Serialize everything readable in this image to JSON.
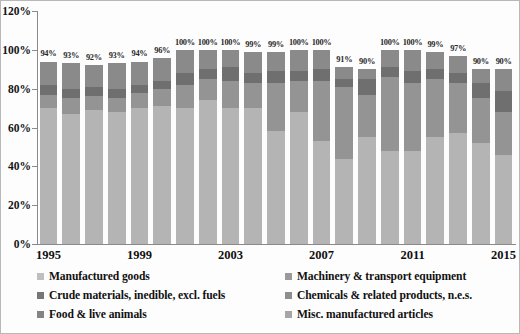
{
  "chart_data": {
    "type": "bar",
    "title": "",
    "subtitle": "",
    "xlabel": "",
    "ylabel": "",
    "stacked": true,
    "grid": false,
    "legend_position": "bottom",
    "ylim": [
      0,
      120
    ],
    "ytick_labels": [
      "0%",
      "20%",
      "40%",
      "60%",
      "80%",
      "100%",
      "120%"
    ],
    "ytick_values": [
      0,
      20,
      40,
      60,
      80,
      100,
      120
    ],
    "categories": [
      1995,
      1996,
      1997,
      1998,
      1999,
      2000,
      2001,
      2002,
      2003,
      2004,
      2005,
      2006,
      2007,
      2008,
      2009,
      2010,
      2011,
      2012,
      2013,
      2014,
      2015
    ],
    "xtick_labels": [
      "1995",
      "1999",
      "2003",
      "2007",
      "2011",
      "2015"
    ],
    "xtick_positions": [
      1995,
      1999,
      2003,
      2007,
      2011,
      2015
    ],
    "data_labels": [
      "94%",
      "93%",
      "92%",
      "93%",
      "94%",
      "96%",
      "100%",
      "100%",
      "100%",
      "99%",
      "99%",
      "100%",
      "100%",
      "91%",
      "90%",
      "100%",
      "100%",
      "99%",
      "97%",
      "90%",
      "90%"
    ],
    "totals": [
      94,
      93,
      92,
      93,
      94,
      96,
      100,
      100,
      100,
      99,
      99,
      100,
      100,
      91,
      90,
      100,
      100,
      99,
      97,
      90,
      90
    ],
    "series": [
      {
        "name": "Manufactured goods",
        "color": "#b4b4b4",
        "values": [
          70,
          67,
          69,
          68,
          70,
          71,
          70,
          74,
          70,
          70,
          58,
          68,
          53,
          44,
          55,
          48,
          48,
          55,
          57,
          52,
          46
        ]
      },
      {
        "name": "Machinery & transport equipment",
        "color": "#949494",
        "values": [
          7,
          8,
          7,
          7,
          8,
          9,
          12,
          11,
          14,
          13,
          25,
          16,
          31,
          37,
          22,
          38,
          35,
          30,
          26,
          23,
          22
        ]
      },
      {
        "name": "Crude materials, inedible, excl. fuels",
        "color": "#6f6f6f",
        "values": [
          5,
          5,
          5,
          5,
          4,
          4,
          6,
          5,
          7,
          5,
          6,
          5,
          6,
          4,
          8,
          5,
          6,
          5,
          5,
          8,
          11
        ]
      },
      {
        "name": "Chemicals & related products, n.e.s.",
        "color": "#8a8a8a",
        "values": [
          12,
          13,
          11,
          13,
          12,
          12,
          12,
          10,
          9,
          11,
          10,
          11,
          10,
          6,
          5,
          9,
          11,
          9,
          9,
          7,
          11
        ]
      },
      {
        "name": "Food & live animals",
        "color": "#808080",
        "values": [
          0,
          0,
          0,
          0,
          0,
          0,
          0,
          0,
          0,
          0,
          0,
          0,
          0,
          0,
          0,
          0,
          0,
          0,
          0,
          0,
          0
        ]
      },
      {
        "name": "Misc. manufactured articles",
        "color": "#a0a0a0",
        "values": [
          0,
          0,
          0,
          0,
          0,
          0,
          0,
          0,
          0,
          0,
          0,
          0,
          0,
          0,
          0,
          0,
          0,
          0,
          0,
          0,
          0
        ]
      }
    ]
  },
  "legend": {
    "items": [
      {
        "label": "Manufactured goods",
        "color": "#bfbfbf"
      },
      {
        "label": "Machinery & transport equipment",
        "color": "#9a9a9a"
      },
      {
        "label": "Crude materials, inedible, excl. fuels",
        "color": "#767676"
      },
      {
        "label": "Chemicals & related products, n.e.s.",
        "color": "#8e8e8e"
      },
      {
        "label": "Food & live animals",
        "color": "#848484"
      },
      {
        "label": "Misc. manufactured articles",
        "color": "#a6a6a6"
      }
    ]
  }
}
